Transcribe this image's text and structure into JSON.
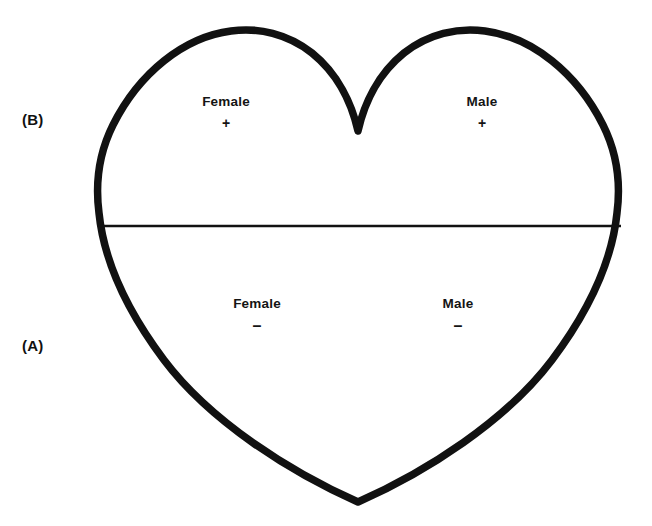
{
  "figure": {
    "type": "heart-diagram",
    "background_color": "#ffffff",
    "outline_color": "#111111",
    "divider_color": "#111111",
    "panels": [
      {
        "id": "B",
        "label": "(B)",
        "position": "upper-half"
      },
      {
        "id": "A",
        "label": "(A)",
        "position": "lower-half"
      }
    ],
    "regions": [
      {
        "id": "female-plus",
        "name": "Female",
        "sign": "+",
        "panel": "B",
        "half": "upper",
        "side": "left"
      },
      {
        "id": "male-plus",
        "name": "Male",
        "sign": "+",
        "panel": "B",
        "half": "upper",
        "side": "right"
      },
      {
        "id": "female-minus",
        "name": "Female",
        "sign": "–",
        "panel": "A",
        "half": "lower",
        "side": "left"
      },
      {
        "id": "male-minus",
        "name": "Male",
        "sign": "–",
        "panel": "A",
        "half": "lower",
        "side": "right"
      }
    ]
  }
}
